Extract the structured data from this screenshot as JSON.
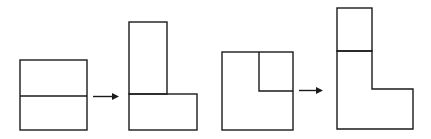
{
  "diagram": {
    "stroke_color": "#1a1a1a",
    "background": "#ffffff",
    "panels": [
      {
        "id": "transformation-1",
        "before": "square divided horizontally into two equal rectangles",
        "after": "L-shape: one rectangle standing vertically on top of the other lying horizontally"
      },
      {
        "id": "transformation-2",
        "before": "square with small square notch marked in upper-right corner",
        "after": "L-shape with the small square placed on top"
      }
    ],
    "arrows": 2
  }
}
